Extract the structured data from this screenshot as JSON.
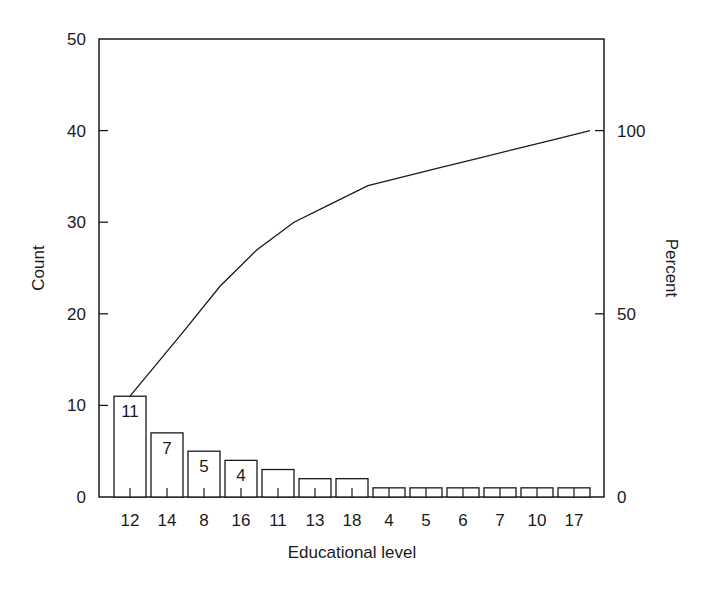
{
  "chart_data": {
    "type": "bar",
    "subtype": "pareto",
    "title": "",
    "xlabel": "Educational level",
    "ylabel": "Count",
    "y2label": "Percent",
    "categories": [
      "12",
      "14",
      "8",
      "16",
      "11",
      "13",
      "18",
      "4",
      "5",
      "6",
      "7",
      "10",
      "17"
    ],
    "series": [
      {
        "name": "Count",
        "type": "bar",
        "axis": "left",
        "values": [
          11,
          7,
          5,
          4,
          3,
          2,
          2,
          1,
          1,
          1,
          1,
          1,
          1
        ]
      },
      {
        "name": "Cumulative percent",
        "type": "line",
        "axis": "right",
        "values": [
          27.5,
          45.0,
          57.5,
          67.5,
          75.0,
          80.0,
          85.0,
          87.5,
          90.0,
          92.5,
          95.0,
          97.5,
          100.0
        ]
      }
    ],
    "bar_labels": [
      "11",
      "7",
      "5",
      "4",
      "",
      "",
      "",
      "",
      "",
      "",
      "",
      "",
      ""
    ],
    "ylim": [
      0,
      50
    ],
    "yticks": [
      0,
      10,
      20,
      30,
      40,
      50
    ],
    "y2lim": [
      0,
      125
    ],
    "y2ticks": [
      0,
      50,
      100
    ],
    "grid": false,
    "legend": null
  },
  "colors": {
    "ink": "#1a1a1a",
    "background": "#ffffff"
  }
}
